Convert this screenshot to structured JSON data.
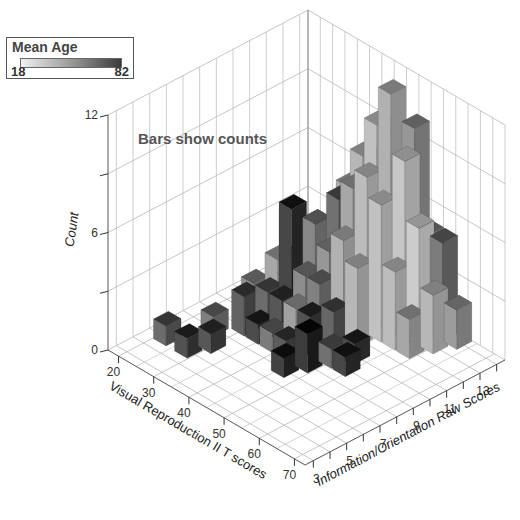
{
  "legend": {
    "title": "Mean Age",
    "min": "18",
    "max": "82"
  },
  "annotation": "Bars show counts",
  "chart_data": {
    "type": "bar3d",
    "title": "",
    "annotation": "Bars show counts",
    "xlabel": "Visual Reproduction II T scores",
    "ylabel": "Information/Orientation Raw Scores",
    "zlabel": "Count",
    "x_ticks": [
      20,
      30,
      40,
      50,
      60,
      70
    ],
    "x_range": [
      17,
      73
    ],
    "y_ticks_labeled": [
      3,
      5,
      7,
      9,
      11,
      13
    ],
    "y_ticks": [
      3,
      4,
      5,
      6,
      7,
      8,
      9,
      10,
      11,
      12,
      13,
      14
    ],
    "y_range": [
      2.5,
      14.5
    ],
    "z_ticks": [
      0,
      3,
      6,
      9,
      12
    ],
    "z_tick_labels": [
      "0",
      "",
      "6",
      "",
      "12"
    ],
    "z_range": [
      0,
      12
    ],
    "color_scale": {
      "label": "Mean Age",
      "min": 18,
      "max": 82,
      "low_color": "#f0f0f0",
      "high_color": "#3a3a3a"
    },
    "bars": [
      {
        "x": 22,
        "y": 5,
        "count": 1,
        "mean_age": 62
      },
      {
        "x": 26,
        "y": 7,
        "count": 1,
        "mean_age": 55
      },
      {
        "x": 28,
        "y": 5,
        "count": 1,
        "mean_age": 72
      },
      {
        "x": 28,
        "y": 9,
        "count": 2,
        "mean_age": 48
      },
      {
        "x": 30,
        "y": 6,
        "count": 1,
        "mean_age": 70
      },
      {
        "x": 30,
        "y": 8,
        "count": 2,
        "mean_age": 66
      },
      {
        "x": 30,
        "y": 10,
        "count": 3,
        "mean_age": 40
      },
      {
        "x": 32,
        "y": 9,
        "count": 2,
        "mean_age": 62
      },
      {
        "x": 32,
        "y": 11,
        "count": 3,
        "mean_age": 58
      },
      {
        "x": 34,
        "y": 8,
        "count": 1,
        "mean_age": 74
      },
      {
        "x": 34,
        "y": 10,
        "count": 6,
        "mean_age": 76
      },
      {
        "x": 34,
        "y": 12,
        "count": 4,
        "mean_age": 44
      },
      {
        "x": 36,
        "y": 9,
        "count": 2,
        "mean_age": 70
      },
      {
        "x": 36,
        "y": 11,
        "count": 5,
        "mean_age": 52
      },
      {
        "x": 36,
        "y": 13,
        "count": 6,
        "mean_age": 38
      },
      {
        "x": 38,
        "y": 8,
        "count": 1,
        "mean_age": 56
      },
      {
        "x": 38,
        "y": 10,
        "count": 3,
        "mean_age": 50
      },
      {
        "x": 38,
        "y": 12,
        "count": 6,
        "mean_age": 60
      },
      {
        "x": 40,
        "y": 9,
        "count": 2,
        "mean_age": 42
      },
      {
        "x": 40,
        "y": 11,
        "count": 4,
        "mean_age": 46
      },
      {
        "x": 40,
        "y": 13,
        "count": 8,
        "mean_age": 34
      },
      {
        "x": 42,
        "y": 8,
        "count": 1,
        "mean_age": 68
      },
      {
        "x": 42,
        "y": 10,
        "count": 3,
        "mean_age": 54
      },
      {
        "x": 42,
        "y": 12,
        "count": 7,
        "mean_age": 40
      },
      {
        "x": 44,
        "y": 9,
        "count": 2,
        "mean_age": 72
      },
      {
        "x": 44,
        "y": 11,
        "count": 5,
        "mean_age": 36
      },
      {
        "x": 44,
        "y": 13,
        "count": 10,
        "mean_age": 30
      },
      {
        "x": 46,
        "y": 7,
        "count": 1,
        "mean_age": 78
      },
      {
        "x": 46,
        "y": 10,
        "count": 2,
        "mean_age": 64
      },
      {
        "x": 46,
        "y": 12,
        "count": 8,
        "mean_age": 32
      },
      {
        "x": 46,
        "y": 14,
        "count": 9,
        "mean_age": 44
      },
      {
        "x": 48,
        "y": 8,
        "count": 2,
        "mean_age": 80
      },
      {
        "x": 48,
        "y": 11,
        "count": 4,
        "mean_age": 34
      },
      {
        "x": 48,
        "y": 13,
        "count": 12,
        "mean_age": 36
      },
      {
        "x": 50,
        "y": 9,
        "count": 1,
        "mean_age": 60
      },
      {
        "x": 50,
        "y": 12,
        "count": 7,
        "mean_age": 30
      },
      {
        "x": 50,
        "y": 14,
        "count": 10,
        "mean_age": 46
      },
      {
        "x": 52,
        "y": 10,
        "count": 1,
        "mean_age": 74
      },
      {
        "x": 52,
        "y": 13,
        "count": 9,
        "mean_age": 28
      },
      {
        "x": 54,
        "y": 9,
        "count": 1,
        "mean_age": 76
      },
      {
        "x": 54,
        "y": 12,
        "count": 4,
        "mean_age": 32
      },
      {
        "x": 54,
        "y": 14,
        "count": 5,
        "mean_age": 50
      },
      {
        "x": 56,
        "y": 13,
        "count": 6,
        "mean_age": 26
      },
      {
        "x": 58,
        "y": 12,
        "count": 2,
        "mean_age": 40
      },
      {
        "x": 58,
        "y": 14,
        "count": 5,
        "mean_age": 56
      },
      {
        "x": 60,
        "y": 13,
        "count": 3,
        "mean_age": 34
      },
      {
        "x": 62,
        "y": 14,
        "count": 2,
        "mean_age": 44
      }
    ]
  }
}
